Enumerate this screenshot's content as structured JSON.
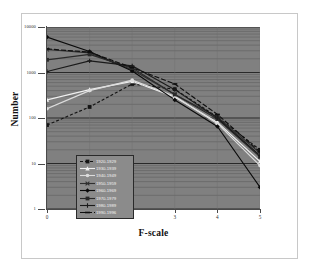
{
  "chart_data": {
    "type": "line",
    "title": "",
    "xlabel": "F-scale",
    "ylabel": "Number",
    "x": [
      0,
      1,
      2,
      3,
      4,
      5
    ],
    "xlim": [
      0,
      5
    ],
    "ylim": [
      1,
      10000
    ],
    "yscale": "log",
    "xtick_labels": [
      "0",
      "1",
      "2",
      "3",
      "4",
      "5"
    ],
    "ytick_labels": [
      "1",
      "10",
      "100",
      "1000",
      "10000"
    ],
    "ytick_values": [
      1,
      10,
      100,
      1000,
      10000
    ],
    "grid": true,
    "grid_minor": true,
    "legend_position": "lower-left-inside",
    "plot_background": "#808080",
    "series": [
      {
        "name": "1920-1929",
        "color": "#141414",
        "dash": "3,2",
        "marker": "square",
        "values": [
          70,
          175,
          560,
          430,
          105,
          20
        ]
      },
      {
        "name": "1930-1939",
        "color": "#f0f0f0",
        "dash": "none",
        "marker": "triangle",
        "values": [
          250,
          420,
          640,
          290,
          80,
          11
        ]
      },
      {
        "name": "1940-1949",
        "color": "#dcdcdc",
        "dash": "none",
        "marker": "circle",
        "values": [
          160,
          400,
          680,
          300,
          75,
          9
        ]
      },
      {
        "name": "1950-1959",
        "color": "#303030",
        "dash": "none",
        "marker": "cross",
        "values": [
          3200,
          2700,
          1150,
          330,
          105,
          17
        ]
      },
      {
        "name": "1960-1969",
        "color": "#0a0a0a",
        "dash": "none",
        "marker": "diamond",
        "values": [
          6000,
          2900,
          1080,
          250,
          65,
          3
        ]
      },
      {
        "name": "1970-1979",
        "color": "#2a2a2a",
        "dash": "none",
        "marker": "square",
        "values": [
          1900,
          2500,
          1250,
          330,
          95,
          14
        ]
      },
      {
        "name": "1980-1989",
        "color": "#1a1a1a",
        "dash": "none",
        "marker": "plus",
        "values": [
          1050,
          1800,
          1400,
          420,
          100,
          15
        ]
      },
      {
        "name": "1990-1996",
        "color": "#0f0f0f",
        "dash": "5,2",
        "marker": "dash",
        "values": [
          3300,
          2800,
          1280,
          560,
          120,
          18
        ]
      }
    ]
  },
  "axes": {
    "x_title": "F-scale",
    "y_title": "Number",
    "x_ticks": [
      {
        "label": "0"
      },
      {
        "label": "1"
      },
      {
        "label": "2"
      },
      {
        "label": "3"
      },
      {
        "label": "4"
      },
      {
        "label": "5"
      }
    ],
    "y_ticks": [
      {
        "label": "10000"
      },
      {
        "label": "1000"
      },
      {
        "label": "100"
      },
      {
        "label": "10"
      },
      {
        "label": "1"
      }
    ]
  },
  "legend": {
    "items": [
      {
        "label": "1920-1929"
      },
      {
        "label": "1930-1939"
      },
      {
        "label": "1940-1949"
      },
      {
        "label": "1950-1959"
      },
      {
        "label": "1960-1969"
      },
      {
        "label": "1970-1979"
      },
      {
        "label": "1980-1989"
      },
      {
        "label": "1990-1996"
      }
    ]
  }
}
